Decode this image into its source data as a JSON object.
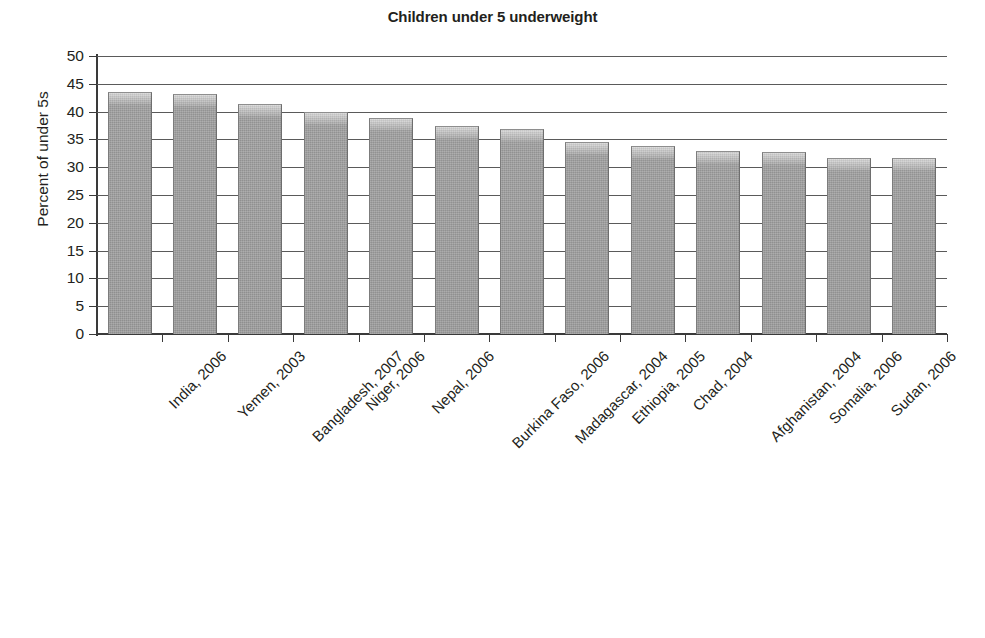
{
  "chart_data": {
    "type": "bar",
    "title": "Children under 5 underweight",
    "xlabel": "",
    "ylabel": "Percent of under 5s",
    "ylim": [
      0,
      50
    ],
    "ytick_step": 5,
    "ytick_labels": [
      "50",
      "45",
      "40",
      "35",
      "30",
      "25",
      "20",
      "15",
      "10",
      "5",
      "0"
    ],
    "grid": true,
    "legend": false,
    "orientation": "vertical",
    "categories": [
      "India, 2006",
      "Yemen, 2003",
      "Bangladesh, 2007",
      "Niger, 2006",
      "Nepal, 2006",
      "Burkina Faso, 2006",
      "Madagascar, 2004",
      "Ethiopia, 2005",
      "Chad, 2004",
      "Afghanistan, 2004",
      "Somalia, 2006",
      "Sudan, 2006",
      "Lao People's Democratic Republic, 2006"
    ],
    "values": [
      43.5,
      43.1,
      41.3,
      39.9,
      38.8,
      37.4,
      36.8,
      34.6,
      33.9,
      32.9,
      32.8,
      31.7,
      31.6
    ],
    "bar_color": "#999999",
    "axis_color": "#3a3a3a",
    "gridline_color": "#5a5a5a",
    "text_color": "#231f20",
    "background_color": "#ffffff",
    "label_rotation_deg": -45
  }
}
